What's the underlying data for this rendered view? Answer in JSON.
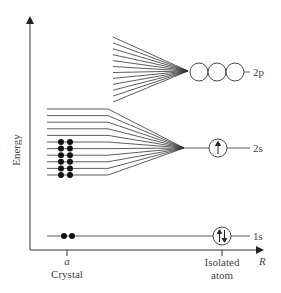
{
  "axes": {
    "y_label": "Energy",
    "x_label": "R",
    "x_tick_crystal_symbol": "a",
    "x_tick_crystal_label": "Crystal",
    "x_tick_atom_label_line1": "Isolated",
    "x_tick_atom_label_line2": "atom"
  },
  "levels": {
    "level_2p": "2p",
    "level_2s": "2s",
    "level_1s": "1s"
  },
  "colors": {
    "line": "#333333",
    "text": "#444444"
  },
  "band_2p": {
    "line_count": 12,
    "x_start": 113,
    "y_top": 37,
    "y_bottom": 102,
    "converge_x": 188,
    "converge_y": 71,
    "orbitals": 3
  },
  "band_2s": {
    "line_count": 11,
    "x_start": 47,
    "x_bend": 108,
    "y_top": 109,
    "y_bottom": 175,
    "converge_x": 184,
    "converge_y": 148,
    "filled_lines": 6
  },
  "level_1s_line": {
    "y": 236,
    "electrons_crystal": 2,
    "electrons_atom": 2
  }
}
